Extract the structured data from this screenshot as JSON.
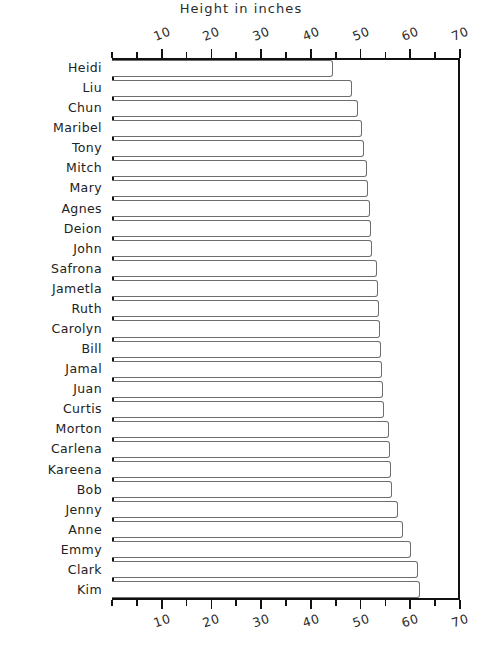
{
  "chart_data": {
    "type": "bar",
    "orientation": "horizontal",
    "title": "Height in inches",
    "xlabel": "",
    "ylabel": "",
    "xlim": [
      0,
      70
    ],
    "ylim": [
      0,
      27
    ],
    "grid": false,
    "legend": null,
    "x_major_ticks": [
      10,
      20,
      30,
      40,
      50,
      60,
      70
    ],
    "x_minor_ticks": [
      0,
      5,
      15,
      25,
      35,
      45,
      55,
      65
    ],
    "x_tick_labels": [
      "10",
      "20",
      "30",
      "40",
      "50",
      "60",
      "70"
    ],
    "axis_top": true,
    "axis_bottom": true,
    "categories": [
      "Heidi",
      "Liu",
      "Chun",
      "Maribel",
      "Tony",
      "Mitch",
      "Mary",
      "Agnes",
      "Deion",
      "John",
      "Safrona",
      "Jametla",
      "Ruth",
      "Carolyn",
      "Bill",
      "Jamal",
      "Juan",
      "Curtis",
      "Morton",
      "Carlena",
      "Kareena",
      "Bob",
      "Jenny",
      "Anne",
      "Emmy",
      "Clark",
      "Kim"
    ],
    "values": [
      44.5,
      48.3,
      49.5,
      50.2,
      50.6,
      51.2,
      51.5,
      51.8,
      52.0,
      52.2,
      53.4,
      53.6,
      53.8,
      54.0,
      54.2,
      54.4,
      54.6,
      54.8,
      55.8,
      56.0,
      56.2,
      56.4,
      57.6,
      58.5,
      60.2,
      61.5,
      62.0
    ],
    "bar_face_color": "#ffffff",
    "bar_edge_color": "#6d6d6d",
    "axis_color": "#111111",
    "text_color": "#222222",
    "style": "hand-drawn"
  }
}
